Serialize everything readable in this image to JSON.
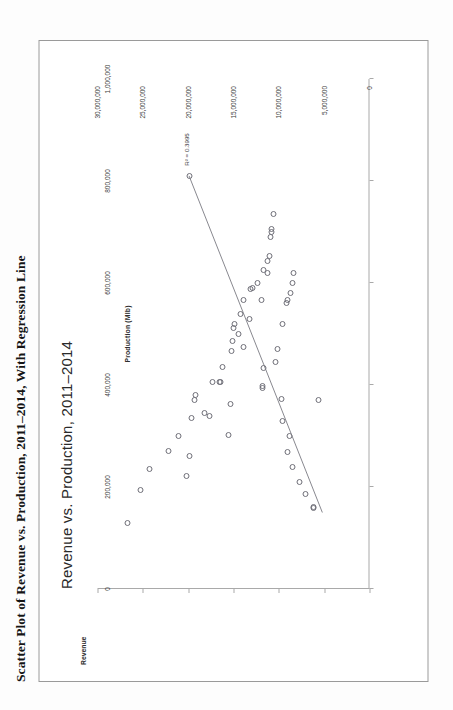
{
  "document": {
    "title": "Scatter Plot of Revenue vs. Production, 2011–2014, With Regression Line"
  },
  "chart_data": {
    "type": "scatter",
    "title": "Revenue vs. Production, 2011–2014",
    "xlabel": "Production (Mlb)",
    "ylabel": "Revenue",
    "xlim": [
      0,
      1000000
    ],
    "ylim": [
      0,
      30000000
    ],
    "grid": false,
    "legend": false,
    "x_ticks": [
      0,
      200000,
      400000,
      600000,
      800000,
      1000000
    ],
    "x_tick_labels": [
      "0",
      "200,000",
      "400,000",
      "600,000",
      "800,000",
      "1,000,000"
    ],
    "y_ticks": [
      0,
      5000000,
      10000000,
      15000000,
      20000000,
      25000000,
      30000000
    ],
    "y_tick_labels": [
      "0",
      "5,000,000",
      "10,000,000",
      "15,000,000",
      "20,000,000",
      "25,000,000",
      "30,000,000"
    ],
    "annotation": {
      "r_squared_text": "R² = 0.3995",
      "r_squared_value": 0.3995,
      "x": 830000,
      "y": 20600000
    },
    "trendline": {
      "type": "linear",
      "x_start": 150000,
      "y_start": 5200000,
      "x_end": 810000,
      "y_end": 19900000,
      "color": "#7a7a82"
    },
    "series": [
      {
        "name": "Revenue vs. Production",
        "marker": "open-circle",
        "color": "#6f6f78",
        "points": [
          [
            130000,
            26700000
          ],
          [
            195000,
            25300000
          ],
          [
            235000,
            24300000
          ],
          [
            270000,
            22200000
          ],
          [
            300000,
            21100000
          ],
          [
            222000,
            20200000
          ],
          [
            260000,
            19800000
          ],
          [
            335000,
            19600000
          ],
          [
            370000,
            19300000
          ],
          [
            380000,
            19200000
          ],
          [
            345000,
            18200000
          ],
          [
            340000,
            17700000
          ],
          [
            405000,
            17300000
          ],
          [
            405000,
            16500000
          ],
          [
            406000,
            16450000
          ],
          [
            435000,
            16200000
          ],
          [
            302000,
            15500000
          ],
          [
            363000,
            15300000
          ],
          [
            466000,
            15200000
          ],
          [
            486000,
            15100000
          ],
          [
            512000,
            15000000
          ],
          [
            520000,
            14900000
          ],
          [
            500000,
            14400000
          ],
          [
            540000,
            14200000
          ],
          [
            475000,
            13900000
          ],
          [
            566000,
            13850000
          ],
          [
            530000,
            13200000
          ],
          [
            588000,
            13100000
          ],
          [
            590000,
            12900000
          ],
          [
            600000,
            12400000
          ],
          [
            566000,
            11900000
          ],
          [
            625000,
            11700000
          ],
          [
            620000,
            11300000
          ],
          [
            643000,
            11250000
          ],
          [
            653000,
            11000000
          ],
          [
            690000,
            10900000
          ],
          [
            700000,
            10850000
          ],
          [
            705000,
            10800000
          ],
          [
            736000,
            10600000
          ],
          [
            810000,
            19900000
          ],
          [
            395000,
            11850000
          ],
          [
            398000,
            11800000
          ],
          [
            433000,
            11700000
          ],
          [
            446000,
            10400000
          ],
          [
            470000,
            10100000
          ],
          [
            520000,
            9600000
          ],
          [
            560000,
            9100000
          ],
          [
            566000,
            9000000
          ],
          [
            580000,
            8700000
          ],
          [
            600000,
            8500000
          ],
          [
            620000,
            8350000
          ],
          [
            372000,
            9700000
          ],
          [
            330000,
            9600000
          ],
          [
            268000,
            9000000
          ],
          [
            300000,
            8800000
          ],
          [
            240000,
            8450000
          ],
          [
            210000,
            7700000
          ],
          [
            186000,
            7100000
          ],
          [
            158000,
            6200000
          ],
          [
            160000,
            6150000
          ],
          [
            370000,
            5600000
          ]
        ]
      }
    ]
  }
}
